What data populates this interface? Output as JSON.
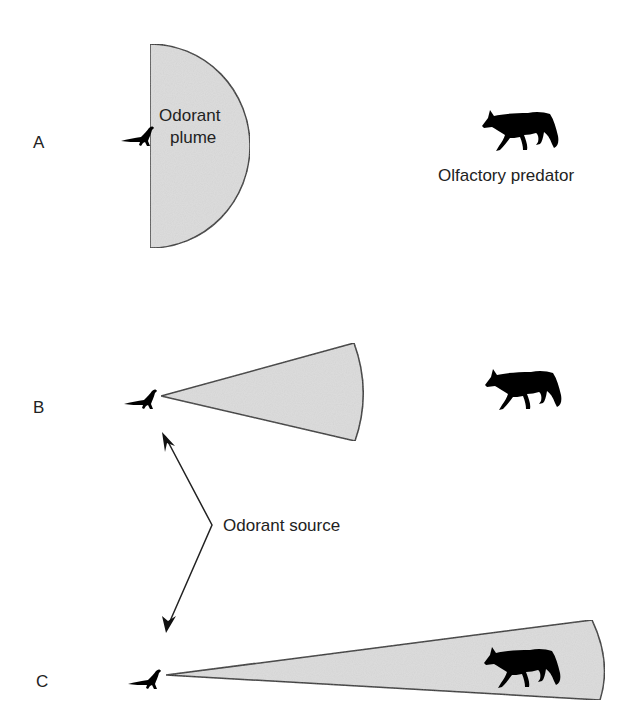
{
  "panels": [
    {
      "letter": "A",
      "plume_shape": "semicircle",
      "plume_label_line1": "Odorant",
      "plume_label_line2": "plume",
      "predator_label": "Olfactory predator",
      "predator_inside_plume": false
    },
    {
      "letter": "B",
      "plume_shape": "narrow-cone",
      "predator_inside_plume": false
    },
    {
      "letter": "C",
      "plume_shape": "long-narrow-cone",
      "predator_inside_plume": true
    }
  ],
  "annotation": {
    "label": "Odorant source"
  },
  "colors": {
    "plume_fill": "#dcdcdc",
    "outline": "#333333",
    "silhouette": "#000000",
    "text": "#222222"
  }
}
